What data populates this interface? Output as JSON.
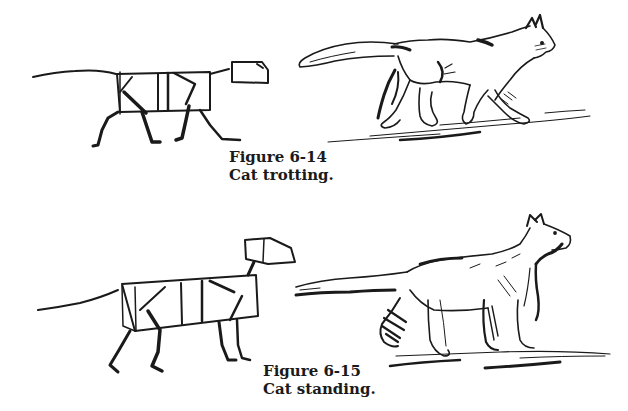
{
  "figures": [
    {
      "number": "Figure 6-14",
      "title": "Cat trotting.",
      "drawings": [
        "box-construction-sketch",
        "finished-cat-sketch"
      ]
    },
    {
      "number": "Figure 6-15",
      "title": "Cat standing.",
      "drawings": [
        "box-construction-sketch",
        "finished-cat-sketch"
      ]
    }
  ],
  "colors": {
    "ink": "#1a1a1a",
    "paper": "#ffffff"
  }
}
